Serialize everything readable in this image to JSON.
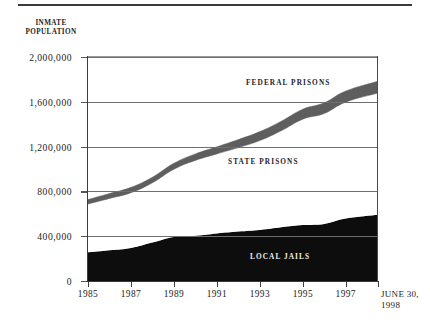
{
  "figure": {
    "axis_title": "INMATE\nPOPULATION",
    "has_top_rule": true
  },
  "chart_data": {
    "type": "area",
    "title": "",
    "subtitle": "",
    "xlabel": "",
    "ylabel": "INMATE POPULATION",
    "ylim": [
      0,
      2000000
    ],
    "xlim": [
      1985,
      1998.5
    ],
    "grid": true,
    "legend_position": "inline-annotations",
    "ytick_labels": [
      "2,000,000",
      "1,600,000",
      "1,200,000",
      "800,000",
      "400,000",
      "0"
    ],
    "ytick_values": [
      2000000,
      1600000,
      1200000,
      800000,
      400000,
      0
    ],
    "xtick_labels": [
      "1985",
      "1987",
      "1989",
      "1991",
      "1993",
      "1995",
      "1997",
      "JUNE 30,\n1998"
    ],
    "xtick_values": [
      1985,
      1987,
      1989,
      1991,
      1993,
      1995,
      1997,
      1998.5
    ],
    "x": [
      1985,
      1986,
      1987,
      1988,
      1989,
      1990,
      1991,
      1992,
      1993,
      1994,
      1995,
      1996,
      1997,
      1998.5
    ],
    "series": [
      {
        "name": "LOCAL JAILS",
        "color": "#0d0d0d",
        "values": [
          256000,
          274000,
          295000,
          343000,
          393000,
          403000,
          424000,
          441000,
          455000,
          479000,
          499000,
          510000,
          558000,
          592000
        ]
      },
      {
        "name": "STATE PRISONS",
        "color": "#ffffff",
        "values": [
          431000,
          463000,
          493000,
          534000,
          605000,
          674000,
          711000,
          750000,
          799000,
          863000,
          946000,
          986000,
          1039000,
          1086000
        ]
      },
      {
        "name": "FEDERAL PRISONS",
        "color": "#5e5e5e",
        "values": [
          40000,
          44000,
          48000,
          50000,
          53000,
          58000,
          63000,
          72000,
          80000,
          85000,
          89000,
          95000,
          99000,
          106000
        ]
      }
    ],
    "totals": [
      727000,
      781000,
      836000,
      927000,
      1051000,
      1135000,
      1198000,
      1263000,
      1334000,
      1427000,
      1534000,
      1591000,
      1696000,
      1784000
    ],
    "annotations": [
      {
        "text": "FEDERAL PRISONS",
        "x_px": 158,
        "y_px": 21,
        "on_dark": false
      },
      {
        "text": "STATE PRISONS",
        "x_px": 140,
        "y_px": 100,
        "on_dark": false
      },
      {
        "text": "LOCAL JAILS",
        "x_px": 162,
        "y_px": 195,
        "on_dark": true
      }
    ]
  }
}
